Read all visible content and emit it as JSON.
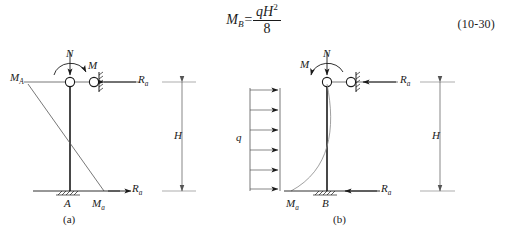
{
  "equation": {
    "lhs": "M",
    "lhs_sub": "B",
    "equals": "=",
    "numerator_q": "q",
    "numerator_H": "H",
    "numerator_exp": "2",
    "denominator": "8",
    "number": "(10-30)"
  },
  "figure_a": {
    "caption": "(a)",
    "labels": {
      "axial_force": "N",
      "moment": "M",
      "moment_top_left": "M",
      "moment_top_left_sub": "A",
      "reaction_top": "R",
      "reaction_top_sub": "a",
      "reaction_bottom": "R",
      "reaction_bottom_sub": "a",
      "support_point": "A",
      "base_moment": "M",
      "base_moment_sub": "a",
      "height": "H"
    }
  },
  "figure_b": {
    "caption": "(b)",
    "labels": {
      "axial_force": "N",
      "moment": "M",
      "distributed_load": "q",
      "reaction_top": "R",
      "reaction_top_sub": "a",
      "reaction_bottom": "R",
      "reaction_bottom_sub": "a",
      "support_point": "B",
      "base_moment": "M",
      "base_moment_sub": "a",
      "height": "H"
    },
    "load_arrow_count": 6
  },
  "style": {
    "stroke": "#1a1a1a",
    "thin_stroke": "#555555",
    "background": "#ffffff"
  }
}
